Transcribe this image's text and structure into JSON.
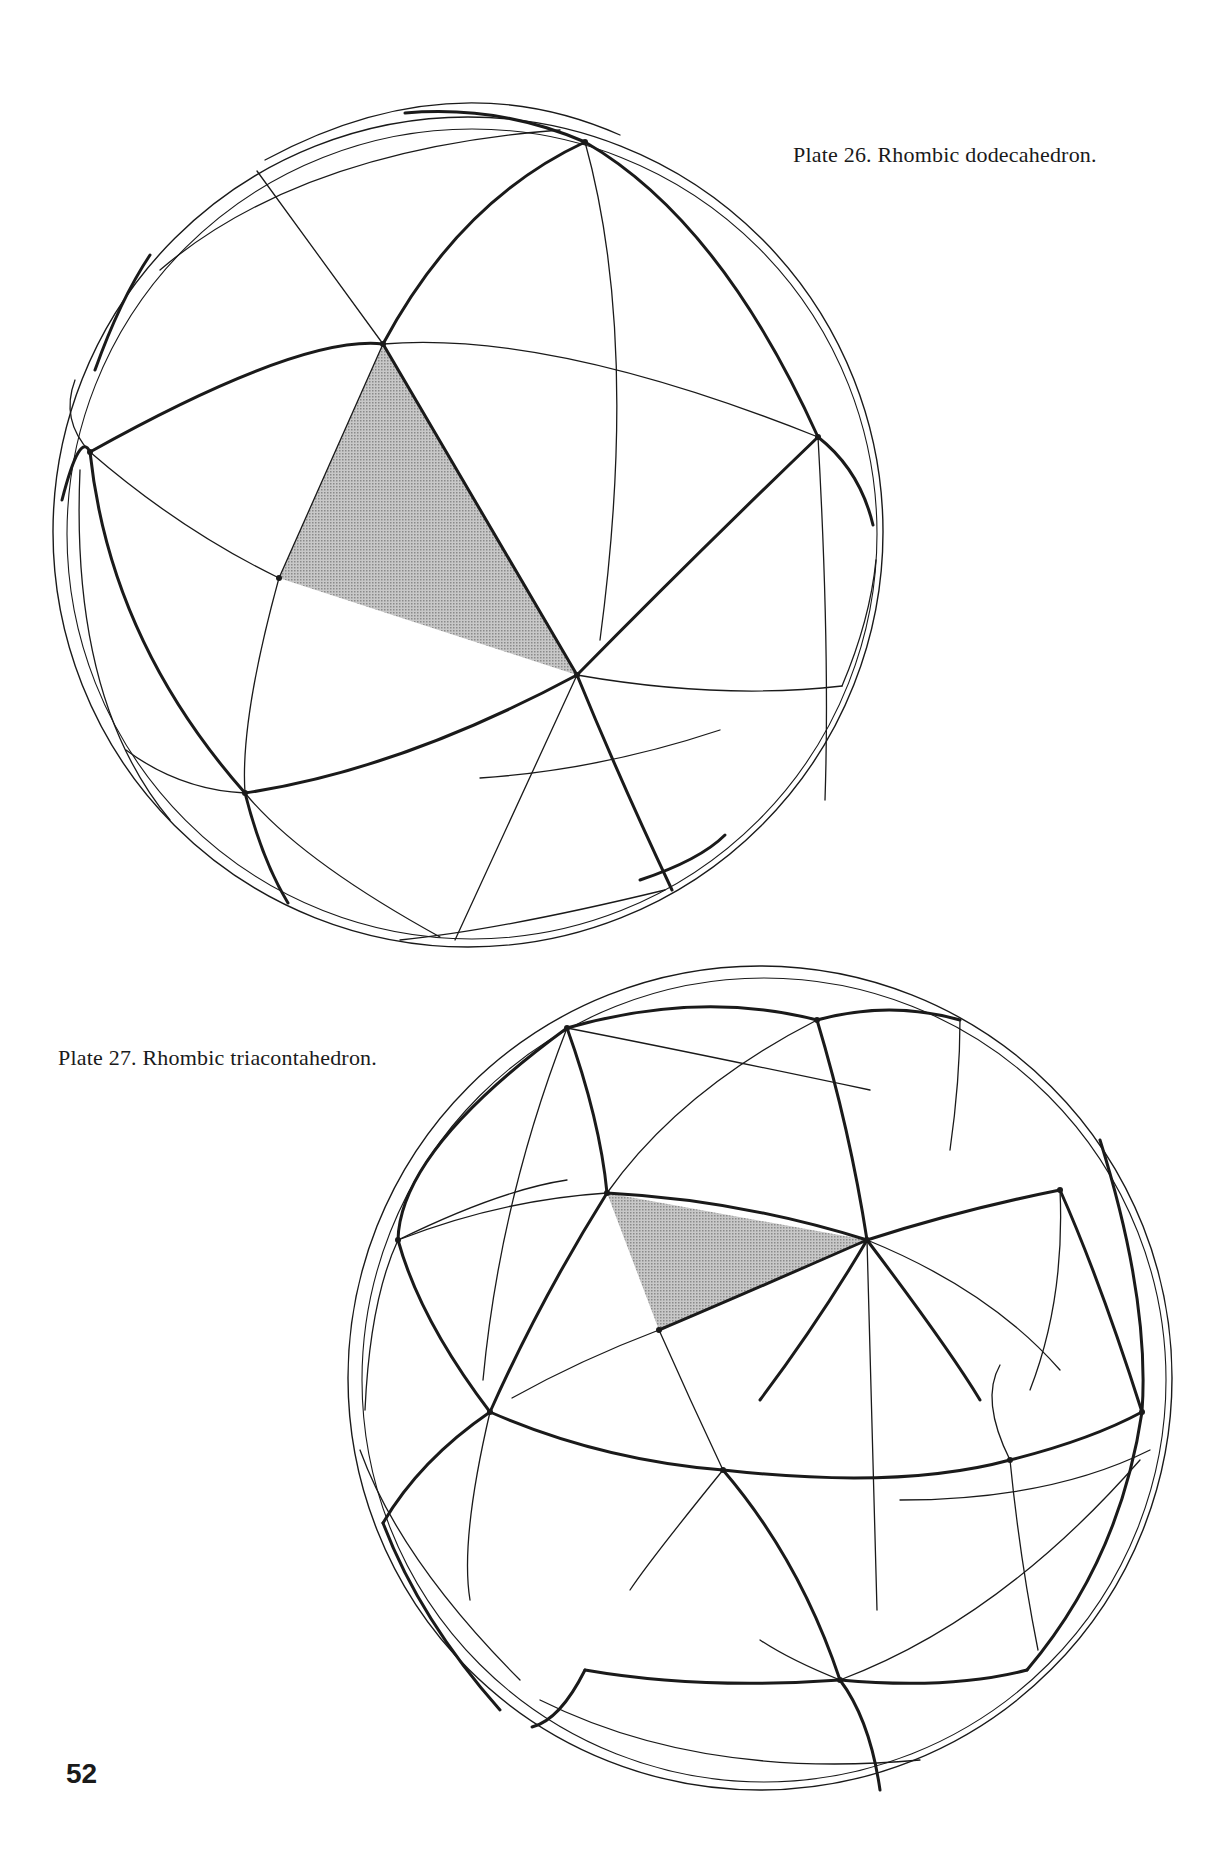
{
  "page": {
    "number": "52",
    "background": "#ffffff",
    "ink": "#1a1a1a",
    "shade": "#b8b8b8"
  },
  "plates": [
    {
      "id": "plate-26",
      "caption": "Plate 26.  Rhombic dodecahedron.",
      "sphere": {
        "cx": 468,
        "cy": 532,
        "r": 415
      },
      "shaded_face": [
        [
          383,
          344
        ],
        [
          577,
          675
        ],
        [
          279,
          578
        ]
      ],
      "thick_arcs": [
        "M 383 344 Q 300 335 90 452",
        "M 383 344 Q 460 200 585 142",
        "M 383 344 L 577 675",
        "M 577 675 Q 690 560 818 437",
        "M 577 675 Q 400 770 245 793",
        "M 577 675 Q 620 780 672 890",
        "M 90 452 Q 110 640 245 793",
        "M 585 142 Q 720 220 818 437",
        "M 585 142 Q 500 105 405 113",
        "M 245 793 Q 262 860 288 903",
        "M 818 437 Q 860 470 873 525",
        "M 90 452 Q 80 430 62 500",
        "M 150 255 Q 120 300 95 370",
        "M 640 880 Q 700 860 725 835"
      ],
      "thin_arcs": [
        "M 383 344 Q 550 330 818 437",
        "M 383 344 L 257 171",
        "M 279 578 Q 240 720 245 793",
        "M 279 578 Q 180 530 90 452",
        "M 279 578 L 383 344",
        "M 577 675 Q 720 700 842 686",
        "M 577 675 Q 520 800 455 940",
        "M 585 142 Q 640 340 600 640",
        "M 818 437 Q 830 650 825 800",
        "M 90 452 Q 60 420 75 380",
        "M 245 793 Q 300 860 440 937",
        "M 245 793 Q 180 790 126 750",
        "M 842 686 Q 870 620 876 560",
        "M 265 160 Q 450 60 620 135",
        "M 160 270 Q 300 150 560 130",
        "M 80 470 Q 70 700 170 820",
        "M 720 730 Q 600 770 480 778",
        "M 400 940 Q 500 930 665 890"
      ],
      "vertices": [
        [
          383,
          344
        ],
        [
          577,
          675
        ],
        [
          90,
          452
        ],
        [
          585,
          142
        ],
        [
          818,
          437
        ],
        [
          245,
          793
        ],
        [
          279,
          578
        ]
      ]
    },
    {
      "id": "plate-27",
      "caption": "Plate 27.  Rhombic triacontahedron.",
      "sphere": {
        "cx": 760,
        "cy": 1378,
        "r": 412
      },
      "shaded_face": [
        [
          607,
          1193
        ],
        [
          867,
          1240
        ],
        [
          659,
          1330
        ]
      ],
      "thick_arcs": [
        "M 567 1028 Q 400 1150 398 1240",
        "M 567 1028 Q 600 1120 607 1193",
        "M 567 1028 Q 700 990 817 1020",
        "M 817 1020 Q 890 1000 960 1020",
        "M 817 1020 Q 850 1130 867 1240",
        "M 607 1193 Q 740 1200 867 1240",
        "M 607 1193 Q 540 1300 490 1412",
        "M 867 1240 Q 960 1210 1060 1190",
        "M 867 1240 Q 730 1300 659 1330",
        "M 867 1240 Q 950 1350 980 1400",
        "M 867 1240 Q 820 1320 760 1400",
        "M 1060 1190 Q 1100 1280 1142 1412",
        "M 398 1240 Q 420 1320 490 1412",
        "M 490 1412 Q 600 1460 723 1470",
        "M 723 1470 Q 900 1490 1010 1460",
        "M 723 1470 Q 800 1560 840 1680",
        "M 1010 1460 Q 1090 1440 1142 1412",
        "M 490 1412 Q 420 1460 383 1523",
        "M 840 1680 Q 870 1720 880 1790",
        "M 840 1680 Q 950 1690 1027 1670",
        "M 840 1680 Q 700 1690 585 1670",
        "M 585 1670 Q 560 1720 532 1727",
        "M 1027 1670 Q 1120 1560 1142 1412",
        "M 1142 1412 Q 1150 1300 1100 1140",
        "M 383 1523 Q 420 1620 500 1710"
      ],
      "thin_arcs": [
        "M 607 1193 Q 500 1200 398 1240",
        "M 607 1193 Q 680 1090 817 1020",
        "M 567 1028 Q 680 1050 870 1090",
        "M 567 1028 Q 500 1200 483 1380",
        "M 659 1330 Q 580 1360 512 1398",
        "M 659 1330 Q 690 1400 723 1470",
        "M 867 1240 Q 870 1350 877 1610",
        "M 867 1240 Q 990 1290 1060 1370",
        "M 1060 1190 Q 1065 1300 1030 1390",
        "M 960 1020 Q 960 1080 950 1150",
        "M 723 1470 Q 650 1560 630 1590",
        "M 1010 1460 Q 1020 1560 1038 1650",
        "M 1010 1460 Q 980 1400 1000 1365",
        "M 840 1680 Q 1000 1620 1140 1460",
        "M 840 1680 Q 790 1660 760 1640",
        "M 490 1412 Q 460 1540 470 1600",
        "M 398 1240 Q 370 1300 365 1410",
        "M 360 1450 Q 400 1560 520 1680",
        "M 540 1700 Q 700 1780 920 1760",
        "M 398 1240 Q 500 1190 567 1180",
        "M 900 1500 Q 1050 1500 1150 1450"
      ],
      "vertices": [
        [
          567,
          1028
        ],
        [
          817,
          1020
        ],
        [
          607,
          1193
        ],
        [
          867,
          1240
        ],
        [
          398,
          1240
        ],
        [
          490,
          1412
        ],
        [
          723,
          1470
        ],
        [
          1010,
          1460
        ],
        [
          1142,
          1412
        ],
        [
          840,
          1680
        ],
        [
          1060,
          1190
        ],
        [
          659,
          1330
        ]
      ]
    }
  ]
}
